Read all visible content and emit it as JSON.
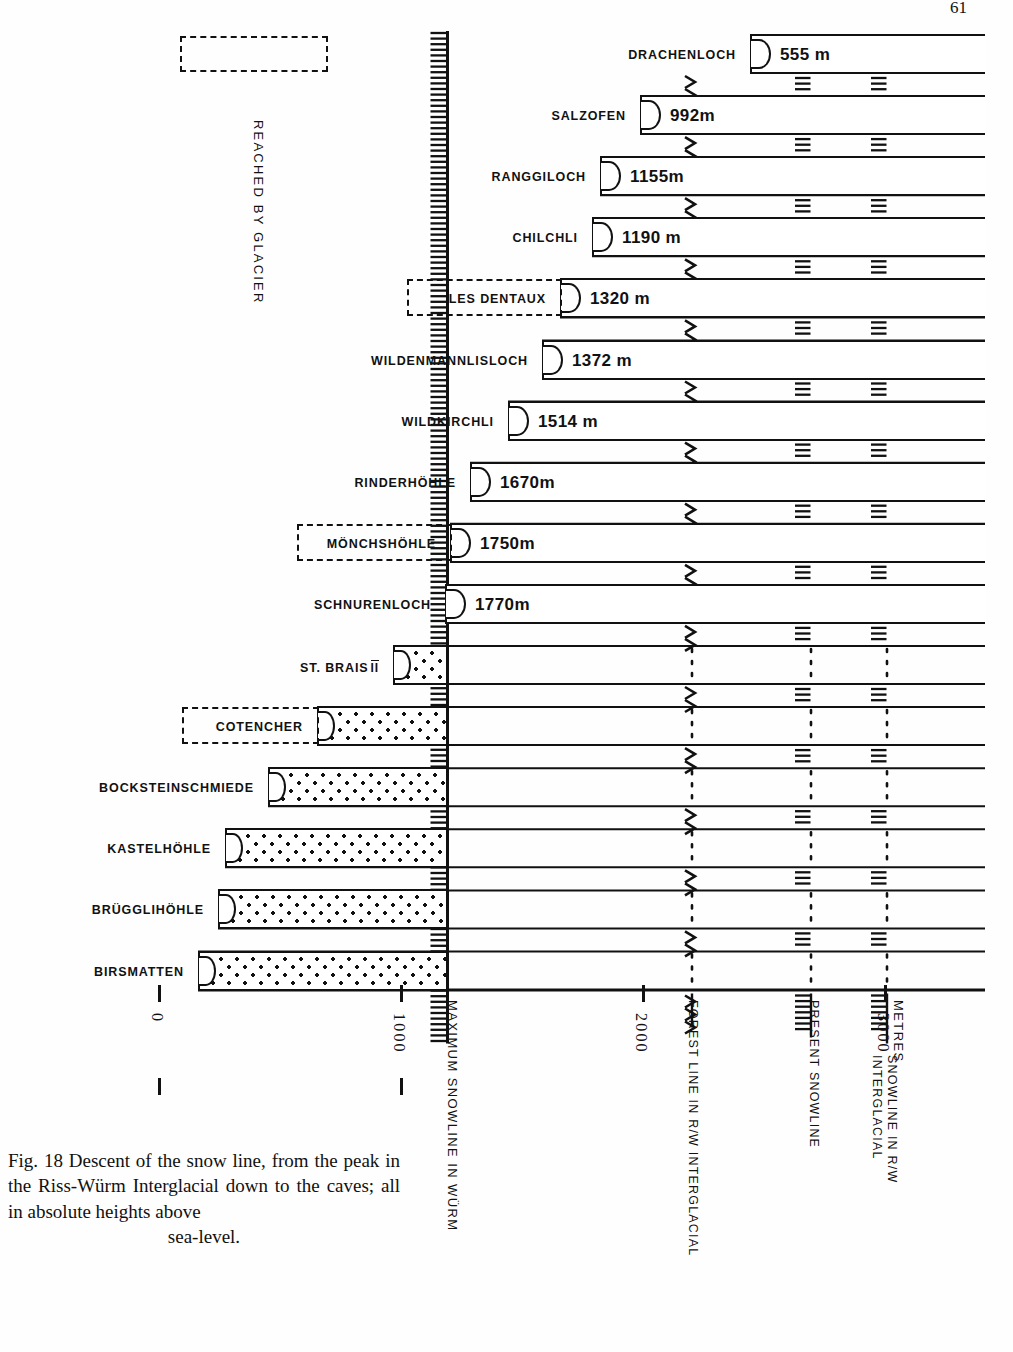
{
  "page": {
    "number": "61"
  },
  "figure": {
    "caption_lines": [
      "Fig. 18 Descent of the snow line, from the",
      "peak in the Riss-Würm Interglacial down",
      "to the caves; all in absolute heights above"
    ],
    "caption_last_line": "sea-level.",
    "glacier_legend": "REACHED BY GLACIER"
  },
  "axis": {
    "unit_label": "METRES",
    "ticks": [
      {
        "label": "0",
        "value": 0
      },
      {
        "label": "1000",
        "value": 1000
      },
      {
        "label": "2000",
        "value": 2000
      },
      {
        "label": "3000",
        "value": 3000
      }
    ]
  },
  "reference_lines": [
    {
      "id": "max-snowline-wurm",
      "label": "MAXIMUM SNOWLINE IN WÜRM",
      "value": 1230,
      "style": "hachured"
    },
    {
      "id": "forest-line-rw",
      "label": "FOREST LINE IN R/W INTERGLACIAL",
      "value": 2230,
      "style": "chevron"
    },
    {
      "id": "present-snowline",
      "label": "PRESENT SNOWLINE",
      "value": 2730,
      "style": "hachured"
    },
    {
      "id": "snowline-rw-interglacial",
      "label": "SNOWLINE IN R/W\nINTERGLACIAL",
      "label_l1": "SNOWLINE IN  R/W",
      "label_l2": "INTERGLACIAL",
      "value": 3010,
      "style": "hachured"
    }
  ],
  "chart_data": {
    "type": "bar",
    "title": "Descent of the snow line, from the peak in the Riss-Würm Interglacial down to the caves; all in absolute heights above sea-level.",
    "xlabel": "METRES",
    "ylabel": "",
    "xlim": [
      0,
      3300
    ],
    "grid": false,
    "orientation": "horizontal",
    "value_unit": "m",
    "categories": [
      "DRACHENLOCH",
      "SALZOFEN",
      "RANGGILOCH",
      "CHILCHLI",
      "LES DENTAUX",
      "WILDENMANNLISLOCH",
      "WILDKIRCHLI",
      "RINDERHÖHLE",
      "MÖNCHSHÖHLE",
      "SCHNURENLOCH",
      "ST. BRAIS II",
      "COTENCHER",
      "BOCKSTEINSCHMIEDE",
      "KASTELHÖHLE",
      "BRÜGGLIHÖHLE",
      "BIRSMATTEN"
    ],
    "values": [
      555,
      992,
      1155,
      1190,
      1320,
      1372,
      1514,
      1670,
      1750,
      1770,
      1180,
      1000,
      885,
      760,
      720,
      640
    ],
    "annotations": [
      "Bars from DRACHENLOCH to SCHNURENLOCH are drawn open and labelled with altitude in metres.",
      "Bars from ST. BRAIS II downwards are stippled (below the maximum Würm snowline) and carry no altitude label."
    ]
  },
  "caves": [
    {
      "name": "DRACHENLOCH",
      "value_label": "555 m",
      "boxed": false,
      "style": "open",
      "bar_left": 750,
      "bar_right": 985
    },
    {
      "name": "SALZOFEN",
      "value_label": "992m",
      "boxed": false,
      "style": "open",
      "bar_left": 640,
      "bar_right": 985
    },
    {
      "name": "RANGGILOCH",
      "value_label": "1155m",
      "boxed": false,
      "style": "open",
      "bar_left": 600,
      "bar_right": 985
    },
    {
      "name": "CHILCHLI",
      "value_label": "1190 m",
      "boxed": false,
      "style": "open",
      "bar_left": 592,
      "bar_right": 985
    },
    {
      "name": "LES DENTAUX",
      "value_label": "1320 m",
      "boxed": true,
      "style": "open",
      "bar_left": 560,
      "bar_right": 985
    },
    {
      "name": "WILDENMANNLISLOCH",
      "value_label": "1372 m",
      "boxed": false,
      "style": "open",
      "bar_left": 542,
      "bar_right": 985
    },
    {
      "name": "WILDKIRCHLI",
      "value_label": "1514 m",
      "boxed": false,
      "style": "open",
      "bar_left": 508,
      "bar_right": 985
    },
    {
      "name": "RINDERHÖHLE",
      "value_label": "1670m",
      "boxed": false,
      "style": "open",
      "bar_left": 470,
      "bar_right": 985
    },
    {
      "name": "MÖNCHSHÖHLE",
      "value_label": "1750m",
      "boxed": true,
      "style": "open",
      "bar_left": 450,
      "bar_right": 985
    },
    {
      "name": "SCHNURENLOCH",
      "value_label": "1770m",
      "boxed": false,
      "style": "open",
      "bar_left": 445,
      "bar_right": 985
    },
    {
      "name": "ST. BRAIS II",
      "value_label": "",
      "boxed": false,
      "style": "stipple",
      "bar_left": 393,
      "bar_right": 985
    },
    {
      "name": "COTENCHER",
      "value_label": "",
      "boxed": true,
      "style": "stipple",
      "bar_left": 317,
      "bar_right": 985
    },
    {
      "name": "BOCKSTEINSCHMIEDE",
      "value_label": "",
      "boxed": false,
      "style": "stipple",
      "bar_left": 268,
      "bar_right": 985
    },
    {
      "name": "KASTELHÖHLE",
      "value_label": "",
      "boxed": false,
      "style": "stipple",
      "bar_left": 225,
      "bar_right": 985
    },
    {
      "name": "BRÜGGLIHÖHLE",
      "value_label": "",
      "boxed": false,
      "style": "stipple",
      "bar_left": 218,
      "bar_right": 985
    },
    {
      "name": "BIRSMATTEN",
      "value_label": "",
      "boxed": false,
      "style": "stipple",
      "bar_left": 198,
      "bar_right": 985
    }
  ]
}
